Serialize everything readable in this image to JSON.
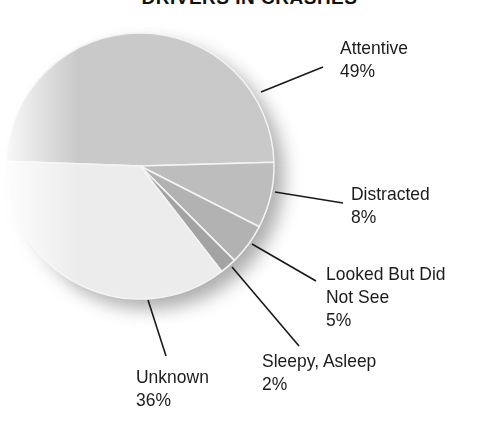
{
  "title": "DRIVERS IN CRASHES",
  "chart_data": {
    "type": "pie",
    "title": "DRIVERS IN CRASHES",
    "categories": [
      "Attentive",
      "Distracted",
      "Looked But Did Not See",
      "Sleepy, Asleep",
      "Unknown"
    ],
    "values": [
      49,
      8,
      5,
      2,
      36
    ],
    "unit": "%",
    "colors": [
      "#c9c9c9",
      "#bdbdbd",
      "#b2b2b2",
      "#a3a3a3",
      "#ececec"
    ],
    "legend": "none (leader-line labels)"
  },
  "labels": [
    {
      "name": "Attentive",
      "lines": [
        "Attentive"
      ],
      "pct": "49%"
    },
    {
      "name": "Distracted",
      "lines": [
        "Distracted"
      ],
      "pct": "8%"
    },
    {
      "name": "Looked But Did Not See",
      "lines": [
        "Looked But Did",
        "Not See"
      ],
      "pct": "5%"
    },
    {
      "name": "Sleepy, Asleep",
      "lines": [
        "Sleepy, Asleep"
      ],
      "pct": "2%"
    },
    {
      "name": "Unknown",
      "lines": [
        "Unknown"
      ],
      "pct": "36%"
    }
  ]
}
